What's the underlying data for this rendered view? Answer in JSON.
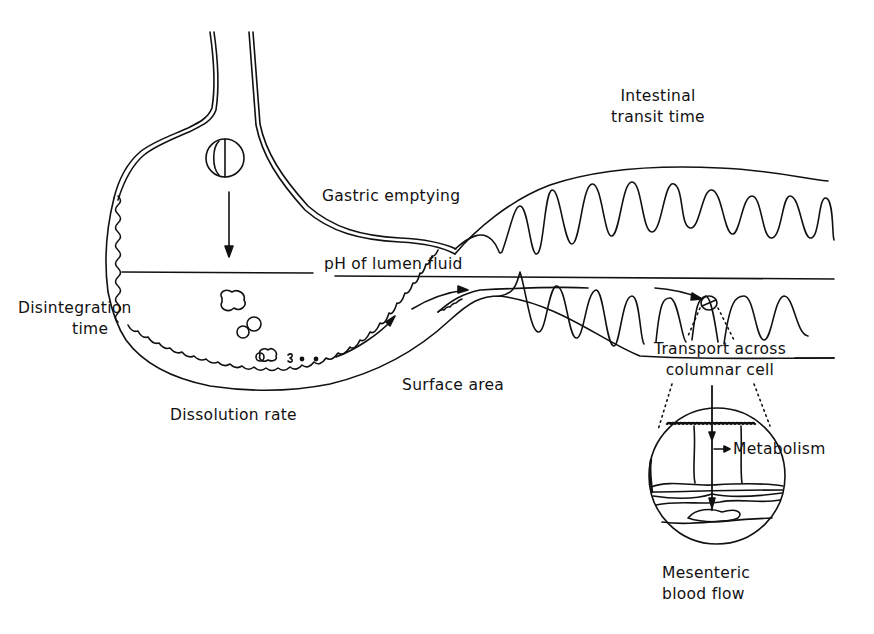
{
  "diagram": {
    "colors": {
      "ink": "#111111",
      "background": "#ffffff"
    },
    "labels": {
      "intestinal_transit_line1": "Intestinal",
      "intestinal_transit_line2": "transit time",
      "gastric_emptying": "Gastric emptying",
      "ph_lumen": "pH of lumen fluid",
      "disintegration_line1": "Disintegration",
      "disintegration_line2": "time",
      "surface_area": "Surface area",
      "dissolution_rate": "Dissolution rate",
      "transport_line1": "Transport across",
      "transport_line2": "columnar cell",
      "metabolism": "Metabolism",
      "mesenteric_line1": "Mesenteric",
      "mesenteric_line2": "blood flow"
    },
    "elements": {
      "esophagus": "esophagus",
      "stomach": "stomach",
      "tablet": "tablet-icon",
      "granules": "disintegrated-granules",
      "intestine": "small-intestine-villi",
      "magnified_cell": "columnar-cell-magnification"
    }
  }
}
